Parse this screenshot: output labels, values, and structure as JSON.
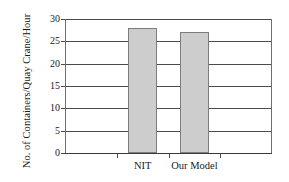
{
  "chart_data": {
    "type": "bar",
    "title": "",
    "subtitle": "",
    "xlabel": "",
    "ylabel": "No. of Containers/Quay Crane/Hour",
    "categories": [
      "NIT",
      "Our Model"
    ],
    "values": [
      28,
      27
    ],
    "series": [
      {
        "name": "No. of Containers/Quay Crane/Hour",
        "values": [
          28,
          27
        ]
      }
    ],
    "ylim": [
      0,
      30
    ],
    "y_ticks": [
      0,
      5,
      10,
      15,
      20,
      25,
      30
    ],
    "y_tick_labels": [
      "0",
      "5",
      "10",
      "15",
      "20",
      "25",
      "30"
    ],
    "grid": true,
    "grid_axis": "y",
    "legend": false,
    "legend_position": "none",
    "bar_color": "#cdcdcd",
    "bar_edge_color": "#7d7d7d",
    "axis_color": "#4a4a4a",
    "background_color": "#ffffff",
    "annotations": []
  }
}
